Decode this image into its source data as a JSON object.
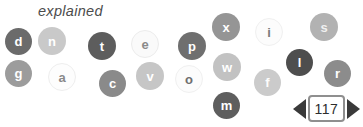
{
  "title": "explained",
  "scatter": {
    "bubbles": [
      {
        "letter": "d",
        "x": 5,
        "y": 28,
        "size": 27,
        "bg": "#6b6b6b",
        "fg": "#ffffff",
        "border": "transparent"
      },
      {
        "letter": "n",
        "x": 38,
        "y": 27,
        "size": 28,
        "bg": "#c9c9c9",
        "fg": "#ffffff",
        "border": "transparent"
      },
      {
        "letter": "t",
        "x": 88,
        "y": 32,
        "size": 28,
        "bg": "#5d5d5d",
        "fg": "#ffffff",
        "border": "transparent"
      },
      {
        "letter": "e",
        "x": 131,
        "y": 30,
        "size": 28,
        "bg": "#fafafa",
        "fg": "#8a8a8a",
        "border": "#ececec"
      },
      {
        "letter": "p",
        "x": 178,
        "y": 32,
        "size": 28,
        "bg": "#6f6f6f",
        "fg": "#ffffff",
        "border": "transparent"
      },
      {
        "letter": "x",
        "x": 212,
        "y": 13,
        "size": 28,
        "bg": "#959595",
        "fg": "#ffffff",
        "border": "transparent"
      },
      {
        "letter": "i",
        "x": 255,
        "y": 18,
        "size": 28,
        "bg": "#fcfcfc",
        "fg": "#7a7a7a",
        "border": "#f0f0f0"
      },
      {
        "letter": "s",
        "x": 310,
        "y": 13,
        "size": 28,
        "bg": "#b2b2b2",
        "fg": "#f0f0f0",
        "border": "transparent"
      },
      {
        "letter": "g",
        "x": 5,
        "y": 60,
        "size": 27,
        "bg": "#9c9c9c",
        "fg": "#ffffff",
        "border": "transparent"
      },
      {
        "letter": "a",
        "x": 48,
        "y": 63,
        "size": 28,
        "bg": "#fdfdfd",
        "fg": "#8a8a8a",
        "border": "#eeeeee"
      },
      {
        "letter": "c",
        "x": 99,
        "y": 70,
        "size": 27,
        "bg": "#8a8a8a",
        "fg": "#ffffff",
        "border": "transparent"
      },
      {
        "letter": "v",
        "x": 136,
        "y": 62,
        "size": 28,
        "bg": "#c6c6c6",
        "fg": "#ffffff",
        "border": "transparent"
      },
      {
        "letter": "o",
        "x": 175,
        "y": 65,
        "size": 28,
        "bg": "#fcfcfc",
        "fg": "#6f6f6f",
        "border": "#f0f0f0"
      },
      {
        "letter": "w",
        "x": 213,
        "y": 53,
        "size": 28,
        "bg": "#c2c2c2",
        "fg": "#ffffff",
        "border": "transparent"
      },
      {
        "letter": "f",
        "x": 254,
        "y": 69,
        "size": 27,
        "bg": "#cbcbcb",
        "fg": "#fdfdfd",
        "border": "transparent"
      },
      {
        "letter": "l",
        "x": 286,
        "y": 49,
        "size": 27,
        "bg": "#4e4e4e",
        "fg": "#ffffff",
        "border": "transparent"
      },
      {
        "letter": "r",
        "x": 324,
        "y": 60,
        "size": 27,
        "bg": "#8c8c8c",
        "fg": "#ffffff",
        "border": "transparent"
      },
      {
        "letter": "m",
        "x": 213,
        "y": 92,
        "size": 27,
        "bg": "#5e5e5e",
        "fg": "#ffffff",
        "border": "transparent"
      }
    ]
  },
  "pager": {
    "page": "117",
    "prev_icon": "triangle-left-icon",
    "next_icon": "triangle-right-icon",
    "arrow_color": "#3a3a3a",
    "box_border_color": "#8f8f8f",
    "text_color": "#2d2d2d"
  }
}
